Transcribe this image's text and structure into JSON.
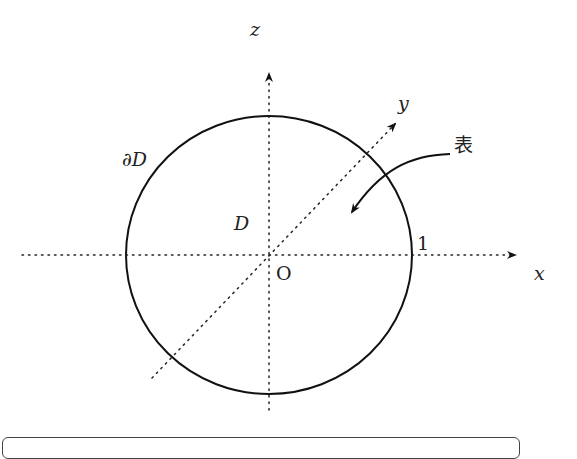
{
  "diagram": {
    "axes": {
      "x_label": "x",
      "y_label": "y",
      "z_label": "z",
      "origin_label": "O"
    },
    "circle": {
      "region_label": "D",
      "boundary_label": "∂D",
      "radius_label": "1"
    },
    "annotation": {
      "label": "表"
    },
    "colors": {
      "stroke": "#111111",
      "background": "#ffffff"
    }
  }
}
